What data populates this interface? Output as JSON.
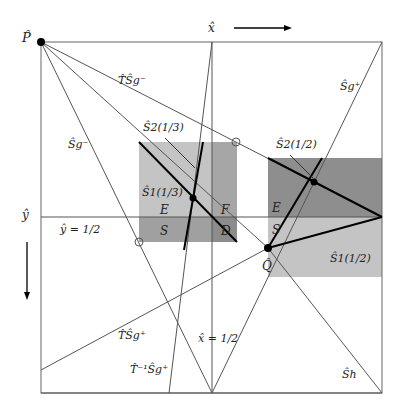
{
  "diagram": {
    "title": "",
    "square": {
      "x0": 41,
      "y0": 42,
      "x1": 382,
      "y1": 393
    },
    "points": {
      "P": {
        "label": "P̂",
        "x": 41,
        "y": 42
      },
      "Q": {
        "label": "Q̂",
        "x": 268,
        "y": 248
      }
    },
    "axis_labels": {
      "x_hat": "x̂",
      "y_hat": "ŷ",
      "x_half": "x̂ = 1/2",
      "y_half": "ŷ = 1/2"
    },
    "curve_labels": {
      "TSg_minus": "T̂Ŝg⁻",
      "Sg_minus": "Ŝg⁻",
      "Sg_plus": "Ŝg⁺",
      "TSg_plus": "T̂Ŝg⁺",
      "Tinv_Sg_plus": "T̂⁻¹Ŝg⁺",
      "Sh": "Ŝh",
      "S2_13": "Ŝ2(1/3)",
      "S1_13": "Ŝ1(1/3)",
      "S2_12": "Ŝ2(1/2)",
      "S1_12": "Ŝ1(1/2)"
    },
    "region_labels": {
      "E_left": "E",
      "F_left": "F",
      "S_left": "S",
      "D_left": "D",
      "E_right": "E",
      "S_right": "S"
    },
    "colors": {
      "light_region": "#c8c8c8",
      "mid_region": "#a9a9a9",
      "dark_region": "#8c8c8c",
      "line": "#555555",
      "thick_line": "#000000"
    }
  }
}
